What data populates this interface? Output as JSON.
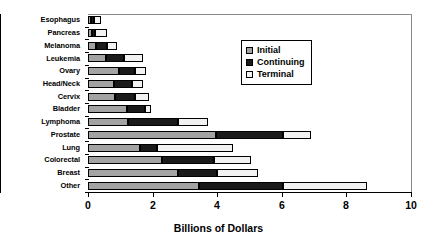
{
  "chart_data": {
    "type": "bar",
    "orientation": "horizontal",
    "stacked": true,
    "title": "",
    "xlabel": "Billions of Dollars",
    "ylabel": "",
    "xlim": [
      0,
      10
    ],
    "ylim": null,
    "grid": false,
    "xticks": [
      0,
      2,
      4,
      6,
      8,
      10
    ],
    "xtick_labels": [
      "0",
      "2",
      "4",
      "6",
      "8",
      "10"
    ],
    "legend_position": "upper-center-right",
    "legend_entries": [
      "Initial",
      "Continuing",
      "Terminal"
    ],
    "categories": [
      "Esophagus",
      "Pancreas",
      "Melanoma",
      "Leukemia",
      "Ovary",
      "Head/Neck",
      "Cervix",
      "Bladder",
      "Lymphoma",
      "Prostate",
      "Lung",
      "Colorectal",
      "Breast",
      "Other"
    ],
    "series": [
      {
        "name": "Initial",
        "color": "#a3a3a3",
        "values": [
          0.1,
          0.12,
          0.25,
          0.55,
          0.95,
          0.8,
          0.85,
          1.2,
          1.25,
          3.95,
          1.6,
          2.3,
          2.8,
          3.45
        ]
      },
      {
        "name": "Continuing",
        "color": "#1a1a1a",
        "values": [
          0.1,
          0.1,
          0.35,
          0.55,
          0.5,
          0.55,
          0.6,
          0.55,
          1.55,
          2.1,
          0.55,
          1.6,
          1.2,
          2.6
        ]
      },
      {
        "name": "Terminal",
        "color": "#f2f2f2",
        "values": [
          0.2,
          0.38,
          0.3,
          0.6,
          0.35,
          0.35,
          0.45,
          0.2,
          0.9,
          0.85,
          2.35,
          1.15,
          1.25,
          2.6
        ]
      }
    ],
    "totals": [
      0.4,
      0.6,
      0.9,
      1.7,
      1.8,
      1.7,
      1.9,
      1.95,
      3.7,
      6.9,
      4.5,
      5.05,
      5.25,
      8.65
    ]
  },
  "legend": {
    "items": [
      {
        "label": "Initial",
        "swatch": "#a3a3a3"
      },
      {
        "label": "Continuing",
        "swatch": "#1a1a1a"
      },
      {
        "label": "Terminal",
        "swatch": "#f2f2f2"
      }
    ]
  },
  "axis": {
    "x_title": "Billions of Dollars"
  }
}
